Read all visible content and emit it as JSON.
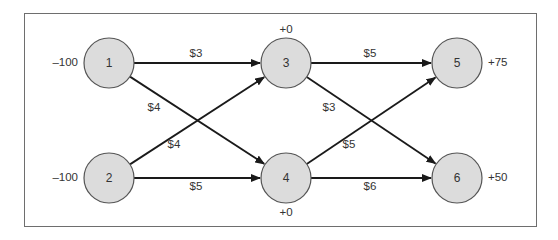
{
  "diagram": {
    "type": "transportation-network",
    "colors": {
      "node_fill": "#dcdcdc",
      "node_stroke": "#555555",
      "edge": "#1a1a1a",
      "frame": "#6e6e6e",
      "text": "#333333"
    },
    "nodes": [
      {
        "id": "1",
        "label": "1",
        "x": 109,
        "y": 63,
        "supply": "–100",
        "supply_pos": "left"
      },
      {
        "id": "2",
        "label": "2",
        "x": 109,
        "y": 178,
        "supply": "–100",
        "supply_pos": "left"
      },
      {
        "id": "3",
        "label": "3",
        "x": 286,
        "y": 63,
        "supply": "+0",
        "supply_pos": "top"
      },
      {
        "id": "4",
        "label": "4",
        "x": 286,
        "y": 178,
        "supply": "+0",
        "supply_pos": "bottom"
      },
      {
        "id": "5",
        "label": "5",
        "x": 457,
        "y": 63,
        "supply": "+75",
        "supply_pos": "right"
      },
      {
        "id": "6",
        "label": "6",
        "x": 457,
        "y": 178,
        "supply": "+50",
        "supply_pos": "right"
      }
    ],
    "edges": [
      {
        "from": "1",
        "to": "3",
        "cost": "$3",
        "lx": 196,
        "ly": 54
      },
      {
        "from": "1",
        "to": "4",
        "cost": "$4",
        "lx": 154,
        "ly": 108
      },
      {
        "from": "2",
        "to": "3",
        "cost": "$4",
        "lx": 174,
        "ly": 145
      },
      {
        "from": "2",
        "to": "4",
        "cost": "$5",
        "lx": 196,
        "ly": 187
      },
      {
        "from": "3",
        "to": "5",
        "cost": "$5",
        "lx": 370,
        "ly": 54
      },
      {
        "from": "3",
        "to": "6",
        "cost": "$3",
        "lx": 329,
        "ly": 108
      },
      {
        "from": "4",
        "to": "5",
        "cost": "$5",
        "lx": 349,
        "ly": 145
      },
      {
        "from": "4",
        "to": "6",
        "cost": "$6",
        "lx": 370,
        "ly": 187
      }
    ]
  }
}
